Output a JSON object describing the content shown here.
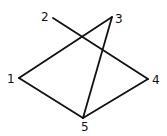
{
  "diagram": {
    "type": "graph",
    "nodes": [
      {
        "id": "1",
        "label": "1",
        "x": 19,
        "y": 78,
        "lx": 7,
        "ly": 83
      },
      {
        "id": "2",
        "label": "2",
        "x": 53,
        "y": 18,
        "lx": 41,
        "ly": 21
      },
      {
        "id": "3",
        "label": "3",
        "x": 112,
        "y": 17,
        "lx": 115,
        "ly": 23
      },
      {
        "id": "4",
        "label": "4",
        "x": 148,
        "y": 79,
        "lx": 152,
        "ly": 84
      },
      {
        "id": "5",
        "label": "5",
        "x": 83,
        "y": 118,
        "lx": 81,
        "ly": 131
      }
    ],
    "edges": [
      {
        "from": "2",
        "to": "4"
      },
      {
        "from": "1",
        "to": "3"
      },
      {
        "from": "3",
        "to": "5"
      },
      {
        "from": "1",
        "to": "5"
      },
      {
        "from": "5",
        "to": "4"
      }
    ]
  }
}
